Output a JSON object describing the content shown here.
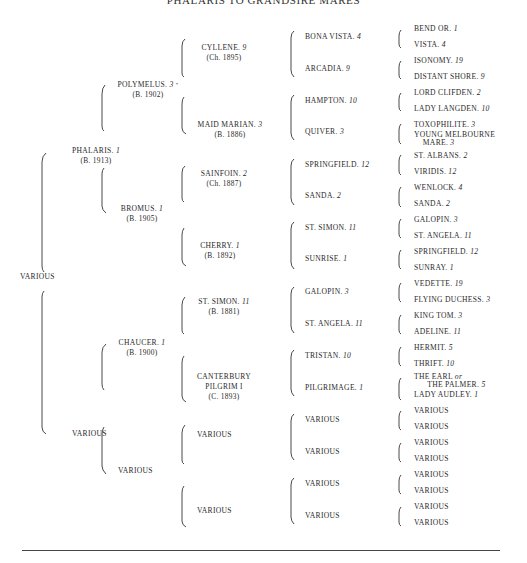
{
  "title": "PHALARIS TO GRANDSIRE MARES",
  "pedigree": {
    "root": {
      "name": "VARIOUS"
    },
    "gen1": [
      {
        "name": "PHALARIS.",
        "num": "1",
        "sub": "(B. 1913)"
      },
      {
        "name": "VARIOUS"
      }
    ],
    "gen2": [
      {
        "name": "POLYMELUS.",
        "num": "3",
        "sub": "(B. 1902)"
      },
      {
        "name": "BROMUS.",
        "num": "1",
        "sub": "(B. 1905)"
      },
      {
        "name": "CHAUCER.",
        "num": "1",
        "sub": "(B. 1900)"
      },
      {
        "name": "VARIOUS"
      }
    ],
    "gen3": [
      {
        "name": "CYLLENE.",
        "num": "9",
        "sub": "(Ch. 1895)"
      },
      {
        "name": "MAID MARIAN.",
        "num": "3",
        "sub": "(B. 1886)"
      },
      {
        "name": "SAINFOIN.",
        "num": "2",
        "sub": "(Ch. 1887)"
      },
      {
        "name": "CHERRY.",
        "num": "1",
        "sub": "(B. 1892)"
      },
      {
        "name": "ST. SIMON.",
        "num": "11",
        "sub": "(B. 1881)"
      },
      {
        "name": "CANTERBURY PILGRIM I",
        "line1": "CANTERBURY",
        "line2": "PILGRIM I",
        "sub": "(C. 1893)"
      },
      {
        "name": "VARIOUS"
      },
      {
        "name": "VARIOUS"
      }
    ],
    "gen4": [
      {
        "name": "BONA VISTA.",
        "num": "4"
      },
      {
        "name": "ARCADIA.",
        "num": "9"
      },
      {
        "name": "HAMPTON.",
        "num": "10"
      },
      {
        "name": "QUIVER.",
        "num": "3"
      },
      {
        "name": "SPRINGFIELD.",
        "num": "12"
      },
      {
        "name": "SANDA.",
        "num": "2"
      },
      {
        "name": "ST. SIMON.",
        "num": "11"
      },
      {
        "name": "SUNRISE.",
        "num": "1"
      },
      {
        "name": "GALOPIN.",
        "num": "3"
      },
      {
        "name": "ST. ANGELA.",
        "num": "11"
      },
      {
        "name": "TRISTAN.",
        "num": "10"
      },
      {
        "name": "PILGRIMAGE.",
        "num": "1"
      },
      {
        "name": "VARIOUS"
      },
      {
        "name": "VARIOUS"
      },
      {
        "name": "VARIOUS"
      },
      {
        "name": "VARIOUS"
      }
    ],
    "gen5": [
      {
        "name": "BEND OR.",
        "num": "1"
      },
      {
        "name": "VISTA.",
        "num": "4"
      },
      {
        "name": "ISONOMY.",
        "num": "19"
      },
      {
        "name": "DISTANT SHORE.",
        "num": "9"
      },
      {
        "name": "LORD CLIFDEN.",
        "num": "2"
      },
      {
        "name": "LADY LANGDEN.",
        "num": "10"
      },
      {
        "name": "TOXOPHILITE.",
        "num": "3"
      },
      {
        "name": "YOUNG MELBOURNE",
        "line2": "MARE.",
        "num": "3"
      },
      {
        "name": "ST. ALBANS.",
        "num": "2"
      },
      {
        "name": "VIRIDIS.",
        "num": "12"
      },
      {
        "name": "WENLOCK.",
        "num": "4"
      },
      {
        "name": "SANDA.",
        "num": "2"
      },
      {
        "name": "GALOPIN.",
        "num": "3"
      },
      {
        "name": "ST. ANGELA.",
        "num": "11"
      },
      {
        "name": "SPRINGFIELD.",
        "num": "12"
      },
      {
        "name": "SUNRAY.",
        "num": "1"
      },
      {
        "name": "VEDETTE.",
        "num": "19"
      },
      {
        "name": "FLYING DUCHESS.",
        "num": "3"
      },
      {
        "name": "KING TOM.",
        "num": "3"
      },
      {
        "name": "ADELINE.",
        "num": "11"
      },
      {
        "name": "HERMIT.",
        "num": "5"
      },
      {
        "name": "THRIFT.",
        "num": "10"
      },
      {
        "name": "THE EARL",
        "or": "or",
        "line2": "THE PALMER.",
        "num": "5"
      },
      {
        "name": "LADY AUDLEY.",
        "num": "1"
      },
      {
        "name": "VARIOUS"
      },
      {
        "name": "VARIOUS"
      },
      {
        "name": "VARIOUS"
      },
      {
        "name": "VARIOUS"
      },
      {
        "name": "VARIOUS"
      },
      {
        "name": "VARIOUS"
      },
      {
        "name": "VARIOUS"
      },
      {
        "name": "VARIOUS"
      }
    ]
  }
}
